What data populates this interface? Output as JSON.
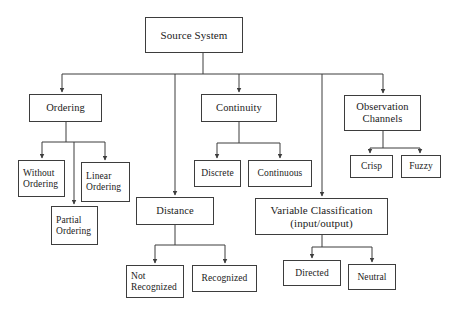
{
  "diagram": {
    "title": "Source System",
    "background_color": "#ffffff",
    "line_color": "#3d3d3d",
    "text_color": "#1a1a1a",
    "nodes": {
      "root": "Source System",
      "ordering": "Ordering",
      "without_ordering": "Without Ordering",
      "linear_ordering": "Linear Ordering",
      "partial_ordering": "Partial Ordering",
      "continuity": "Continuity",
      "discrete": "Discrete",
      "continuous": "Continuous",
      "observation_channels": "Observation Channels",
      "crisp": "Crisp",
      "fuzzy": "Fuzzy",
      "distance": "Distance",
      "not_recognized": "Not Recognized",
      "recognized": "Recognized",
      "variable_classification": "Variable Classification (input/output)",
      "directed": "Directed",
      "neutral": "Neutral"
    },
    "node_lines": {
      "without_ordering_1": "Without",
      "without_ordering_2": "Ordering",
      "linear_ordering_1": "Linear",
      "linear_ordering_2": "Ordering",
      "partial_ordering_1": "Partial",
      "partial_ordering_2": "Ordering",
      "observation_channels_1": "Observation",
      "observation_channels_2": "Channels",
      "not_recognized_1": "Not",
      "not_recognized_2": "Recognized",
      "variable_classification_1": "Variable Classification",
      "variable_classification_2": "(input/output)"
    },
    "edges": [
      {
        "from": "root",
        "to": "ordering"
      },
      {
        "from": "root",
        "to": "continuity"
      },
      {
        "from": "root",
        "to": "observation_channels"
      },
      {
        "from": "root",
        "to": "distance"
      },
      {
        "from": "root",
        "to": "variable_classification"
      },
      {
        "from": "ordering",
        "to": "without_ordering"
      },
      {
        "from": "ordering",
        "to": "partial_ordering"
      },
      {
        "from": "ordering",
        "to": "linear_ordering"
      },
      {
        "from": "continuity",
        "to": "discrete"
      },
      {
        "from": "continuity",
        "to": "continuous"
      },
      {
        "from": "observation_channels",
        "to": "crisp"
      },
      {
        "from": "observation_channels",
        "to": "fuzzy"
      },
      {
        "from": "distance",
        "to": "not_recognized"
      },
      {
        "from": "distance",
        "to": "recognized"
      },
      {
        "from": "variable_classification",
        "to": "directed"
      },
      {
        "from": "variable_classification",
        "to": "neutral"
      }
    ]
  }
}
